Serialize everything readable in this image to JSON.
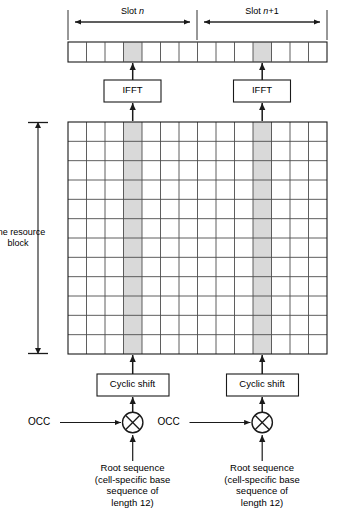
{
  "diagram": {
    "colors": {
      "stroke": "#1a1a1a",
      "grid_line": "#4d4d4d",
      "shaded_cell": "#d9d9d9",
      "background": "#ffffff"
    },
    "timeline": {
      "slots": [
        {
          "id": "slot-n",
          "label": "Slot n",
          "label_prefix": "Slot ",
          "label_italic": "n",
          "label_suffix": ""
        },
        {
          "id": "slot-n-plus-1",
          "label": "Slot n+1",
          "label_prefix": "Slot ",
          "label_italic": "n",
          "label_suffix": "+1"
        }
      ],
      "symbols_per_slot": 7,
      "total_symbols": 14,
      "reference_symbol_index_in_slot": 4,
      "shaded_symbol_indices": [
        3,
        10
      ]
    },
    "resource_grid": {
      "rows": 12,
      "columns": 14,
      "shaded_columns": [
        3,
        10
      ],
      "side_label": "One resource\nblock",
      "side_label_line1": "One resource",
      "side_label_line2": "block"
    },
    "blocks": {
      "ifft": {
        "label": "IFFT",
        "count": 2
      },
      "cyclic_shift": {
        "label": "Cyclic shift",
        "count": 2
      },
      "multiplier": {
        "symbol": "multiply",
        "count": 2
      }
    },
    "inputs": {
      "occ": {
        "label": "OCC",
        "count": 2
      },
      "root_sequence": {
        "label": "Root sequence\n(cell-specific base\nsequence of\nlength 12)",
        "line1": "Root sequence",
        "line2": "(cell-specific base",
        "line3": "sequence of",
        "line4": "length 12)",
        "count": 2
      }
    }
  }
}
